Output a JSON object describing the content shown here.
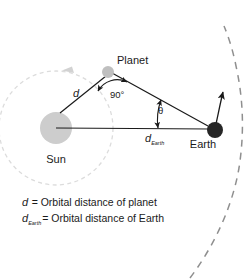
{
  "diagram": {
    "bodies": [
      {
        "id": "sun",
        "label": "Sun",
        "color": "#cccccc",
        "cx": 56,
        "cy": 128,
        "r": 16
      },
      {
        "id": "planet",
        "label": "Planet",
        "color": "#bfbfbf",
        "cx": 108,
        "cy": 72,
        "r": 6
      },
      {
        "id": "earth",
        "label": "Earth",
        "color": "#262626",
        "cx": 215,
        "cy": 130,
        "r": 8
      }
    ],
    "angles": [
      {
        "id": "right-angle",
        "label": "90°",
        "vertex": "planet"
      },
      {
        "id": "elongation-angle",
        "label": "θ",
        "vertex": "earth"
      }
    ],
    "distances": [
      {
        "id": "d",
        "label": "d",
        "from": "sun",
        "to": "planet"
      },
      {
        "id": "d-earth",
        "label": "d",
        "subscript": "Earth",
        "from": "sun",
        "to": "earth"
      }
    ],
    "orbits": [
      {
        "id": "planet-orbit",
        "style": "dashed",
        "color": "#d8d8d8",
        "direction": "counterclockwise"
      },
      {
        "id": "earth-orbit",
        "style": "dashed",
        "color": "#8c8c8c",
        "direction": "counterclockwise"
      }
    ],
    "legend": [
      {
        "symbol": "d",
        "subscript": "",
        "text": "= Orbital distance of planet"
      },
      {
        "symbol": "d",
        "subscript": "Earth",
        "text": "= Orbital distance of Earth"
      }
    ]
  }
}
